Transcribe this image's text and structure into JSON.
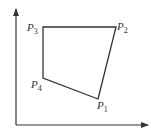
{
  "diagram": {
    "type": "quadrilateral-on-axes",
    "axes": {
      "color": "#333333",
      "origin": [
        16,
        125
      ],
      "x_end": [
        148,
        125
      ],
      "y_end": [
        16,
        9
      ]
    },
    "polygon": {
      "stroke": "#333333",
      "vertices_order": [
        "P1",
        "P2",
        "P3",
        "P4"
      ]
    },
    "points": [
      {
        "id": "P1",
        "letter": "P",
        "subscript": "1",
        "x": 98,
        "y": 99,
        "label_x": 97,
        "label_y": 109
      },
      {
        "id": "P2",
        "letter": "P",
        "subscript": "2",
        "x": 116,
        "y": 27,
        "label_x": 117,
        "label_y": 30
      },
      {
        "id": "P3",
        "letter": "P",
        "subscript": "3",
        "x": 43,
        "y": 27,
        "label_x": 27,
        "label_y": 31
      },
      {
        "id": "P4",
        "letter": "P",
        "subscript": "4",
        "x": 43,
        "y": 78,
        "label_x": 31,
        "label_y": 88
      }
    ]
  }
}
